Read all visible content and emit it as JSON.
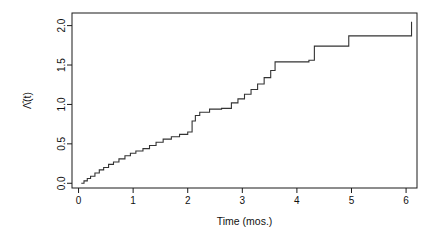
{
  "chart_data": {
    "type": "line",
    "subtype": "step-function",
    "title": "",
    "xlabel": "Time (mos.)",
    "ylabel": "Λ̂(t)",
    "ylabel_plain": "Lambda-hat(t)",
    "xlim": [
      -0.12,
      6.2
    ],
    "ylim": [
      -0.06,
      2.16
    ],
    "xticks": [
      0,
      1,
      2,
      3,
      4,
      5,
      6
    ],
    "xticklabels": [
      "0",
      "1",
      "2",
      "3",
      "4",
      "5",
      "6"
    ],
    "yticks": [
      0.0,
      0.5,
      1.0,
      1.5,
      2.0
    ],
    "yticklabels": [
      "0.0",
      "0.5",
      "1.0",
      "1.5",
      "2.0"
    ],
    "grid": false,
    "legend": false,
    "box": true,
    "line_color": "#333333",
    "line_width": 1.1,
    "series": [
      {
        "name": "Nelson-Aalen cumulative hazard",
        "step": "post",
        "x": [
          0.05,
          0.1,
          0.16,
          0.22,
          0.3,
          0.38,
          0.46,
          0.55,
          0.64,
          0.74,
          0.85,
          0.95,
          1.05,
          1.18,
          1.3,
          1.42,
          1.55,
          1.7,
          1.85,
          2.0,
          2.08,
          2.14,
          2.22,
          2.4,
          2.62,
          2.8,
          2.92,
          3.04,
          3.16,
          3.28,
          3.4,
          3.52,
          3.6,
          4.22,
          4.32,
          4.95,
          6.1
        ],
        "y": [
          0.0,
          0.03,
          0.06,
          0.09,
          0.13,
          0.17,
          0.2,
          0.24,
          0.27,
          0.31,
          0.35,
          0.38,
          0.41,
          0.44,
          0.48,
          0.52,
          0.56,
          0.59,
          0.62,
          0.65,
          0.79,
          0.86,
          0.9,
          0.94,
          0.95,
          1.02,
          1.07,
          1.13,
          1.19,
          1.26,
          1.34,
          1.43,
          1.54,
          1.56,
          1.74,
          1.87,
          2.05
        ]
      }
    ],
    "annotations": []
  },
  "axis": {
    "x_title": "Time (mos.)",
    "y_title": "Λ̂(t)"
  },
  "colors": {
    "background": "#ffffff",
    "axis": "#1a1a1a",
    "line": "#333333",
    "text": "#111111"
  }
}
